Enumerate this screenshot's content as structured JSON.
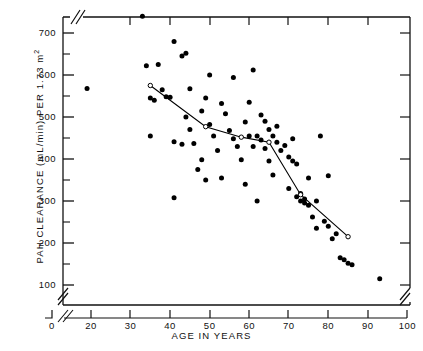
{
  "chart_data": {
    "type": "scatter",
    "title": "",
    "xlabel": "AGE IN YEARS",
    "ylabel": "PAH CLEARANCE (mL/min) PER 1.73 m2",
    "ylabel_main": "PAH CLEARANCE (mL/min) PER 1.73 m",
    "ylabel_exponent": "2",
    "xlim": [
      0,
      100
    ],
    "ylim": [
      50,
      760
    ],
    "grid": false,
    "legend": null,
    "axis_breaks": {
      "x_between": [
        0,
        20
      ],
      "y_below": 100,
      "y_above": 740
    },
    "xticks": [
      0,
      20,
      30,
      40,
      50,
      60,
      70,
      80,
      90,
      100
    ],
    "xtick_labels": [
      "0",
      "20",
      "30",
      "40",
      "50",
      "60",
      "70",
      "80",
      "90",
      "100"
    ],
    "yticks": [
      100,
      200,
      300,
      400,
      500,
      600,
      700
    ],
    "ytick_labels": [
      "100",
      "200",
      "300",
      "400",
      "500",
      "600",
      "700"
    ],
    "yminorticks": [
      150,
      250,
      350,
      450,
      550,
      650,
      750
    ],
    "series": [
      {
        "name": "individual subjects",
        "marker": "filled-circle",
        "color": "#000000",
        "points": [
          [
            19,
            568
          ],
          [
            33,
            740
          ],
          [
            34,
            622
          ],
          [
            35,
            545
          ],
          [
            36,
            540
          ],
          [
            35,
            455
          ],
          [
            37,
            625
          ],
          [
            38,
            565
          ],
          [
            39,
            548
          ],
          [
            40,
            547
          ],
          [
            41,
            308
          ],
          [
            41,
            680
          ],
          [
            41,
            441
          ],
          [
            43,
            645
          ],
          [
            43,
            435
          ],
          [
            44,
            652
          ],
          [
            44,
            500
          ],
          [
            45,
            567
          ],
          [
            45,
            470
          ],
          [
            46,
            437
          ],
          [
            47,
            375
          ],
          [
            48,
            514
          ],
          [
            48,
            398
          ],
          [
            49,
            545
          ],
          [
            49,
            350
          ],
          [
            50,
            600
          ],
          [
            50,
            482
          ],
          [
            51,
            455
          ],
          [
            52,
            420
          ],
          [
            53,
            532
          ],
          [
            53,
            355
          ],
          [
            54,
            508
          ],
          [
            55,
            468
          ],
          [
            56,
            594
          ],
          [
            56,
            448
          ],
          [
            57,
            430
          ],
          [
            58,
            398
          ],
          [
            59,
            488
          ],
          [
            59,
            340
          ],
          [
            60,
            535
          ],
          [
            60,
            455
          ],
          [
            61,
            612
          ],
          [
            61,
            430
          ],
          [
            62,
            455
          ],
          [
            62,
            300
          ],
          [
            63,
            505
          ],
          [
            63,
            445
          ],
          [
            64,
            490
          ],
          [
            64,
            425
          ],
          [
            65,
            470
          ],
          [
            65,
            395
          ],
          [
            66,
            455
          ],
          [
            66,
            362
          ],
          [
            67,
            440
          ],
          [
            67,
            478
          ],
          [
            68,
            420
          ],
          [
            69,
            432
          ],
          [
            70,
            405
          ],
          [
            70,
            330
          ],
          [
            71,
            395
          ],
          [
            71,
            448
          ],
          [
            72,
            388
          ],
          [
            72,
            310
          ],
          [
            73,
            318
          ],
          [
            73,
            300
          ],
          [
            74,
            305
          ],
          [
            74,
            295
          ],
          [
            75,
            355
          ],
          [
            75,
            290
          ],
          [
            76,
            262
          ],
          [
            77,
            300
          ],
          [
            77,
            235
          ],
          [
            78,
            455
          ],
          [
            79,
            252
          ],
          [
            80,
            240
          ],
          [
            80,
            360
          ],
          [
            81,
            210
          ],
          [
            82,
            222
          ],
          [
            83,
            165
          ],
          [
            84,
            160
          ],
          [
            85,
            152
          ],
          [
            86,
            148
          ],
          [
            93,
            115
          ]
        ]
      },
      {
        "name": "decade mean trend",
        "marker": "open-circle",
        "line": true,
        "color": "#000000",
        "points": [
          [
            35,
            575
          ],
          [
            49,
            477
          ],
          [
            58,
            452
          ],
          [
            65,
            440
          ],
          [
            73,
            315
          ],
          [
            85,
            215
          ]
        ]
      }
    ]
  }
}
